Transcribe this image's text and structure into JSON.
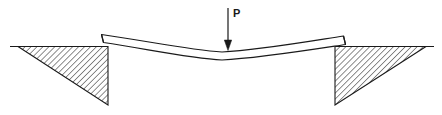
{
  "figure": {
    "type": "engineering-mechanics-diagram",
    "background_color": "#ffffff",
    "line_color": "#1a1a1a",
    "hatch_color": "#3a3a3a",
    "beam_fill": "#ffffff"
  },
  "labels": {
    "load": "P"
  },
  "annotations": {
    "load_arrow": {
      "name": "point-load-arrow",
      "direction": "downward",
      "x": 228,
      "top_y": 8,
      "tip_y": 50,
      "label": "P"
    }
  },
  "geometry": {
    "ground_line_y": 46,
    "left_support": {
      "name": "left-ground-wedge",
      "ground_from_x": 18,
      "ground_to_x": 108,
      "corner_x": 108,
      "bottom_y": 105
    },
    "right_support": {
      "name": "right-ground-wedge",
      "corner_x": 335,
      "ground_from_x": 335,
      "ground_to_x": 426,
      "bottom_y": 105
    },
    "beam": {
      "name": "deflected-beam",
      "left_end_x": 101,
      "right_end_x": 344,
      "midspan_x": 222,
      "midspan_top_y": 52,
      "midspan_bottom_y": 60,
      "thickness_px": 8
    }
  }
}
